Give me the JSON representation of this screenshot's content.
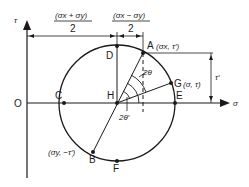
{
  "diagram": {
    "axes": {
      "vertical": "τ",
      "horizontal": "σ",
      "origin": "O"
    },
    "dimensions": {
      "left_numerator": "(σx + σy)",
      "left_denominator": "2",
      "right_numerator": "(σx − σy)",
      "right_denominator": "2",
      "height": "τ′"
    },
    "points": {
      "A": "A",
      "A_coord": "(σx, τ′)",
      "B": "B",
      "B_coord": "(σy, −τ′)",
      "C": "C",
      "D": "D",
      "E": "E",
      "F": "F",
      "G": "G",
      "G_coord": "(σ, τ)",
      "H": "H",
      "I": "I"
    },
    "angles": {
      "two_theta": "2θ",
      "two_theta_prime": "2θ′"
    }
  }
}
